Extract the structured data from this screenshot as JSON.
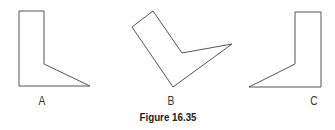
{
  "figure": {
    "caption": "Figure 16.35",
    "stroke_color": "#555555",
    "shapes": [
      {
        "label": "A",
        "points": "19,11 44,11 44,64 90,86 19,86",
        "label_x": 42,
        "label_y": 94
      },
      {
        "label": "B",
        "points": "132,27 153,11 182,53 232,44 173,87",
        "label_x": 171,
        "label_y": 94
      },
      {
        "label": "C",
        "points": "295,12 321,12 321,87 249,87 295,64",
        "label_x": 314,
        "label_y": 94
      }
    ]
  }
}
